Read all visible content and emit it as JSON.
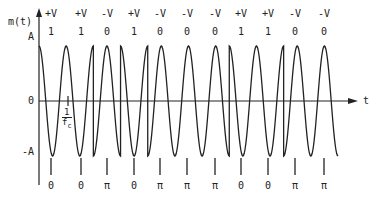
{
  "diagram": {
    "y_axis": {
      "label": "m(t)",
      "ticks": [
        "A",
        "0",
        "-A"
      ]
    },
    "x_axis": {
      "label": "t"
    },
    "period_annotation": {
      "numerator": "1",
      "denominator": "f",
      "subscript": "c"
    },
    "bits": [
      {
        "voltage": "+V",
        "bit": "1",
        "phase": "0"
      },
      {
        "voltage": "+V",
        "bit": "1",
        "phase": "0"
      },
      {
        "voltage": "-V",
        "bit": "0",
        "phase": "π"
      },
      {
        "voltage": "+V",
        "bit": "1",
        "phase": "0"
      },
      {
        "voltage": "-V",
        "bit": "0",
        "phase": "π"
      },
      {
        "voltage": "-V",
        "bit": "0",
        "phase": "π"
      },
      {
        "voltage": "-V",
        "bit": "0",
        "phase": "π"
      },
      {
        "voltage": "+V",
        "bit": "1",
        "phase": "0"
      },
      {
        "voltage": "+V",
        "bit": "1",
        "phase": "0"
      },
      {
        "voltage": "-V",
        "bit": "0",
        "phase": "π"
      },
      {
        "voltage": "-V",
        "bit": "0",
        "phase": "π"
      }
    ],
    "colors": {
      "line": "#222222",
      "background": "#ffffff"
    }
  }
}
